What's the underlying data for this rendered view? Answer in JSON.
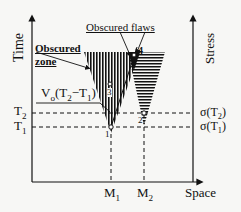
{
  "axes": {
    "left_label": "Time",
    "right_label": "Stress",
    "bottom_label": "Space"
  },
  "annotations": {
    "obscured_zone_line1": "Obscured",
    "obscured_zone_line2": "zone",
    "obscured_flaws": "Obscured flaws",
    "velocity_label": "V",
    "velocity_sub": "o",
    "velocity_paren": "(T",
    "velocity_t2": "2",
    "velocity_minus": "−T",
    "velocity_t1": "1",
    "velocity_close": ")"
  },
  "time_ticks": {
    "t2": "T",
    "t2_sub": "2",
    "t1": "T",
    "t1_sub": "1"
  },
  "stress_ticks": {
    "s2": "σ(T",
    "s2_sub": "2",
    "s2_close": ")",
    "s1": "σ(T",
    "s1_sub": "1",
    "s1_close": ")"
  },
  "space_ticks": {
    "m1": "M",
    "m1_sub": "1",
    "m2": "M",
    "m2_sub": "2"
  },
  "points": {
    "p1": "1",
    "p2": "2",
    "p3": "3",
    "p4": "4"
  },
  "colors": {
    "ink": "#111111",
    "background": "#f7f7f5"
  }
}
